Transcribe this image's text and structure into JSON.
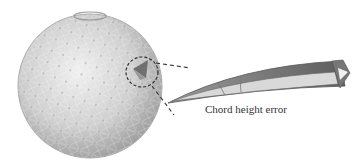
{
  "figure": {
    "label": "Chord height error",
    "elements": {
      "sphere": "tessellated-sphere",
      "highlight": "dashed-circle-around-facet",
      "detail": "enlarged-curved-facet-wedge"
    },
    "colors": {
      "sphere_light": "#e6e6e6",
      "sphere_dark": "#9a9a9a",
      "wedge_dark": "#6e6e6e",
      "wedge_light": "#d8d8d8",
      "dash": "#333333",
      "text": "#333333"
    }
  }
}
